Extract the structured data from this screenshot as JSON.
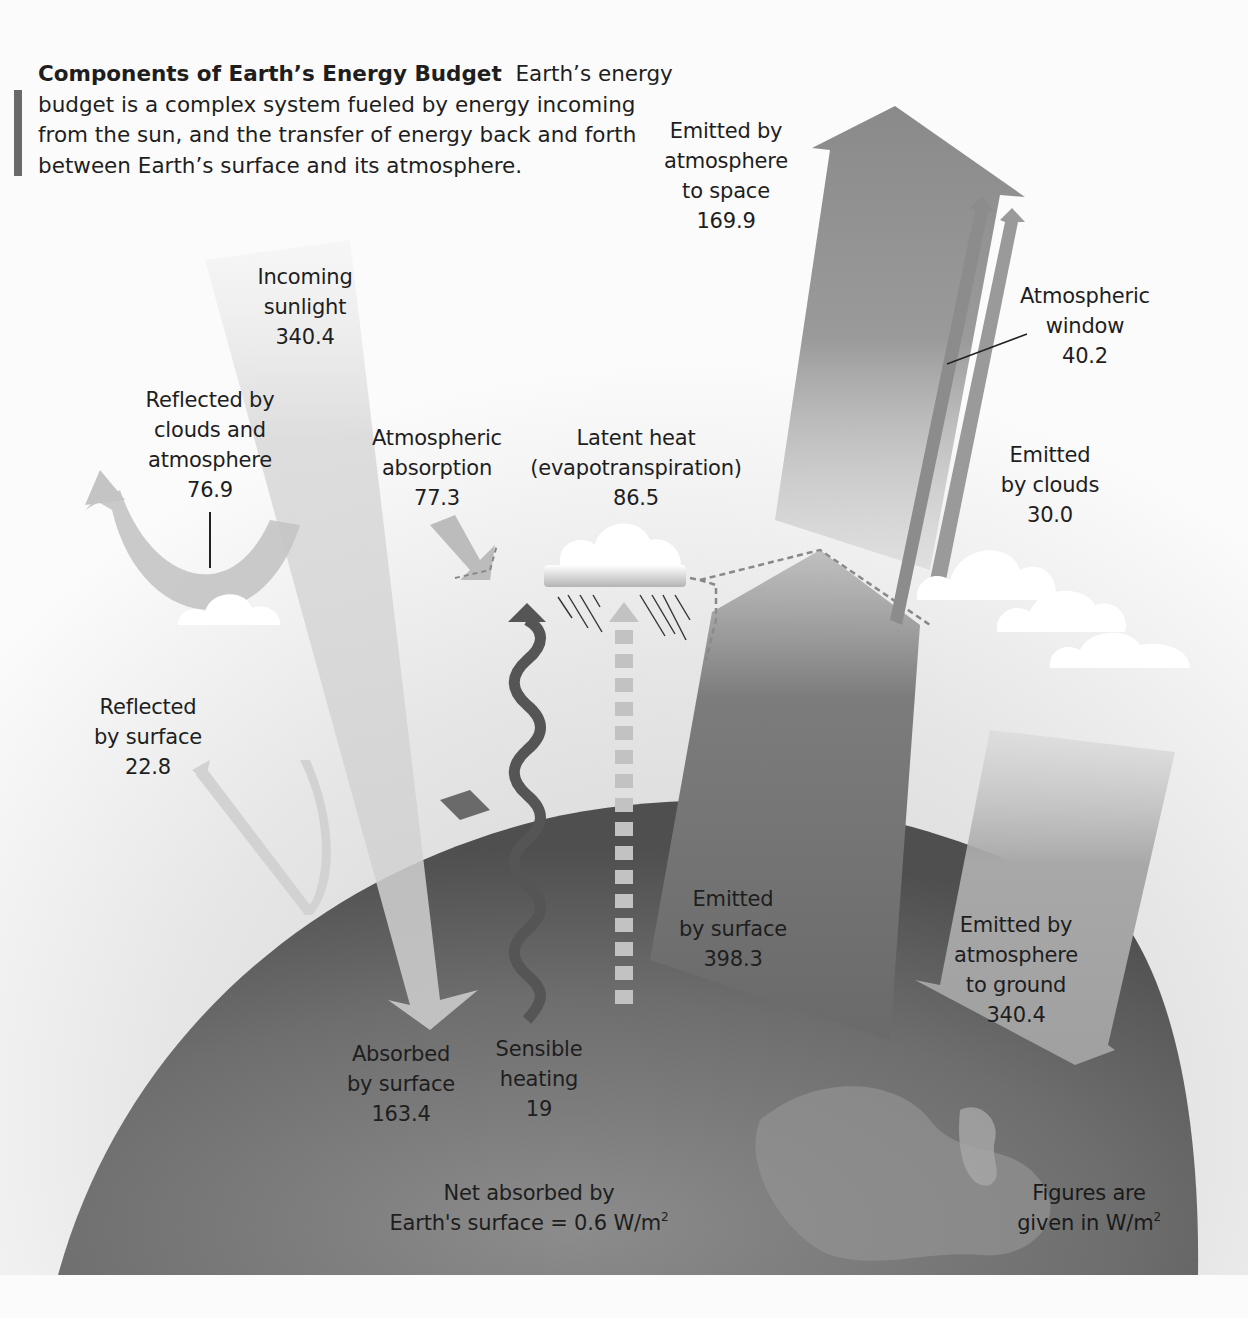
{
  "caption": {
    "title": "Components of Earth’s Energy Budget",
    "text": "Earth’s energy budget is a complex system fueled by energy incoming from the sun, and the transfer of energy back and forth between Earth’s surface and its atmosphere."
  },
  "labels": {
    "incoming_sunlight": {
      "line1": "Incoming",
      "line2": "sunlight",
      "value": "340.4"
    },
    "reflected_clouds": {
      "line1": "Reflected by",
      "line2": "clouds and",
      "line3": "atmosphere",
      "value": "76.9"
    },
    "atmospheric_absorption": {
      "line1": "Atmospheric",
      "line2": "absorption",
      "value": "77.3"
    },
    "latent_heat": {
      "line1": "Latent heat",
      "line2": "(evapotranspiration)",
      "value": "86.5"
    },
    "emitted_space": {
      "line1": "Emitted by",
      "line2": "atmosphere",
      "line3": "to space",
      "value": "169.9"
    },
    "atmospheric_window": {
      "line1": "Atmospheric",
      "line2": "window",
      "value": "40.2"
    },
    "emitted_clouds": {
      "line1": "Emitted",
      "line2": "by clouds",
      "value": "30.0"
    },
    "reflected_surface": {
      "line1": "Reflected",
      "line2": "by surface",
      "value": "22.8"
    },
    "emitted_surface": {
      "line1": "Emitted",
      "line2": "by surface",
      "value": "398.3"
    },
    "emitted_ground": {
      "line1": "Emitted by",
      "line2": "atmosphere",
      "line3": "to ground",
      "value": "340.4"
    },
    "absorbed_surface": {
      "line1": "Absorbed",
      "line2": "by surface",
      "value": "163.4"
    },
    "sensible_heating": {
      "line1": "Sensible",
      "line2": "heating",
      "value": "19"
    },
    "net_absorbed": {
      "line1": "Net absorbed by",
      "line2": "Earth's surface = 0.6 W/m",
      "sup": "2"
    },
    "units_note": {
      "line1": "Figures are",
      "line2": "given in W/m",
      "sup": "2"
    }
  },
  "flows_w_m2": [
    {
      "name": "Incoming sunlight",
      "value": 340.4
    },
    {
      "name": "Reflected by clouds and atmosphere",
      "value": 76.9
    },
    {
      "name": "Reflected by surface",
      "value": 22.8
    },
    {
      "name": "Atmospheric absorption",
      "value": 77.3
    },
    {
      "name": "Absorbed by surface",
      "value": 163.4
    },
    {
      "name": "Sensible heating",
      "value": 19
    },
    {
      "name": "Latent heat (evapotranspiration)",
      "value": 86.5
    },
    {
      "name": "Emitted by surface",
      "value": 398.3
    },
    {
      "name": "Emitted by atmosphere to ground",
      "value": 340.4
    },
    {
      "name": "Emitted by atmosphere to space",
      "value": 169.9
    },
    {
      "name": "Atmospheric window",
      "value": 40.2
    },
    {
      "name": "Emitted by clouds",
      "value": 30.0
    },
    {
      "name": "Net absorbed by Earth's surface",
      "value": 0.6
    }
  ],
  "colors": {
    "earth_dark": "#5c5c5c",
    "earth_mid": "#7a7a7a",
    "sunlight_arrow": "#d6d6d6",
    "emitted_arrow": "#8a8a8a",
    "wave": "#555555",
    "cloud": "#ffffff",
    "text": "#1e1e1e"
  }
}
